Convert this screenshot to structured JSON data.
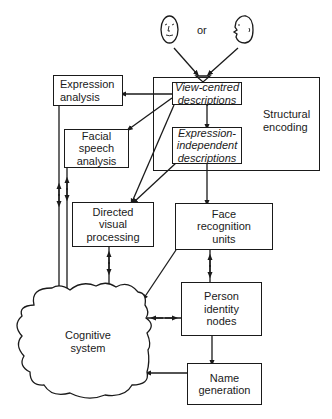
{
  "diagram": {
    "type": "flowchart",
    "title": "",
    "input": {
      "faces": [
        {
          "id": "face-front",
          "icon": "front-face-icon"
        },
        {
          "id": "face-profile",
          "icon": "profile-face-icon"
        }
      ],
      "connector_label": "or"
    },
    "groups": [
      {
        "id": "structural-encoding",
        "label": "Structural\nencoding"
      }
    ],
    "nodes": [
      {
        "id": "view-centred",
        "label": "View-centred\ndescriptions",
        "style": "italic",
        "group": "structural-encoding"
      },
      {
        "id": "expression-independent",
        "label": "Expression-\nindependent\ndescriptions",
        "style": "italic",
        "group": "structural-encoding"
      },
      {
        "id": "expression-analysis",
        "label": "Expression\nanalysis"
      },
      {
        "id": "facial-speech",
        "label": "Facial\nspeech\nanalysis"
      },
      {
        "id": "directed-visual",
        "label": "Directed\nvisual\nprocessing"
      },
      {
        "id": "face-recognition",
        "label": "Face\nrecognition\nunits"
      },
      {
        "id": "person-identity",
        "label": "Person\nidentity\nnodes"
      },
      {
        "id": "name-generation",
        "label": "Name\ngeneration"
      },
      {
        "id": "cognitive-system",
        "label": "Cognitive\nsystem",
        "shape": "cloud"
      }
    ],
    "edges": [
      {
        "from": "face-front",
        "to": "view-centred",
        "direction": "forward"
      },
      {
        "from": "face-profile",
        "to": "view-centred",
        "direction": "forward"
      },
      {
        "from": "view-centred",
        "to": "expression-analysis",
        "direction": "forward"
      },
      {
        "from": "view-centred",
        "to": "facial-speech",
        "direction": "forward"
      },
      {
        "from": "view-centred",
        "to": "directed-visual",
        "direction": "forward"
      },
      {
        "from": "view-centred",
        "to": "expression-independent",
        "direction": "forward"
      },
      {
        "from": "expression-independent",
        "to": "directed-visual",
        "direction": "forward"
      },
      {
        "from": "expression-independent",
        "to": "face-recognition",
        "direction": "forward"
      },
      {
        "from": "expression-analysis",
        "to": "cognitive-system",
        "direction": "bidirectional"
      },
      {
        "from": "facial-speech",
        "to": "cognitive-system",
        "direction": "bidirectional"
      },
      {
        "from": "directed-visual",
        "to": "cognitive-system",
        "direction": "bidirectional"
      },
      {
        "from": "face-recognition",
        "to": "cognitive-system",
        "direction": "forward"
      },
      {
        "from": "face-recognition",
        "to": "person-identity",
        "direction": "bidirectional"
      },
      {
        "from": "person-identity",
        "to": "cognitive-system",
        "direction": "bidirectional"
      },
      {
        "from": "person-identity",
        "to": "name-generation",
        "direction": "forward"
      },
      {
        "from": "name-generation",
        "to": "cognitive-system",
        "direction": "forward"
      }
    ]
  },
  "labels": {
    "or": "or",
    "structural_encoding": "Structural\nencoding",
    "view_centred": "View-centred\ndescriptions",
    "expression_independent": "Expression-\nindependent\ndescriptions",
    "expression_analysis": "Expression\nanalysis",
    "facial_speech": "Facial\nspeech\nanalysis",
    "directed_visual": "Directed\nvisual\nprocessing",
    "face_recognition": "Face\nrecognition\nunits",
    "person_identity": "Person\nidentity\nnodes",
    "name_generation": "Name\ngeneration",
    "cognitive_system": "Cognitive\nsystem"
  },
  "colors": {
    "line": "#1a1a1a",
    "background": "#ffffff"
  }
}
